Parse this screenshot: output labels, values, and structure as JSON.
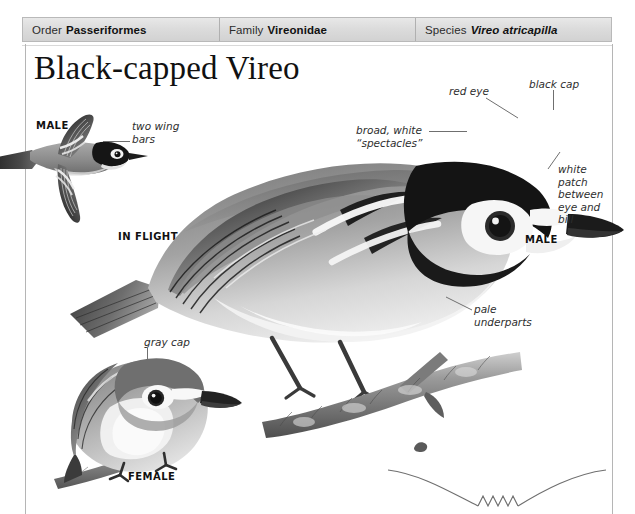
{
  "taxonomy": {
    "order": {
      "rank": "Order",
      "value": "Passeriformes"
    },
    "family": {
      "rank": "Family",
      "value": "Vireonidae"
    },
    "species": {
      "rank": "Species",
      "value": "Vireo atricapilla"
    }
  },
  "title": "Black-capped Vireo",
  "callouts": {
    "two_wing_bars": "two wing\nbars",
    "red_eye": "red eye",
    "black_cap": "black cap",
    "spectacles": "broad, white\n“spectacles”",
    "white_patch": "white\npatch\nbetween\neye and\nbill",
    "pale_underparts": "pale\nunderparts",
    "gray_cap": "gray cap"
  },
  "captions": {
    "male_flight": "MALE",
    "in_flight": "IN FLIGHT",
    "male_perched": "MALE",
    "female": "FEMALE"
  },
  "colors": {
    "page_background": "#ffffff",
    "header_fill": "#dcdcdc",
    "header_border": "#b9b9b9",
    "rule": "#b5b5b5",
    "text": "#1a1a1a",
    "leader_line": "#6f6f6f",
    "plumage_dark": "#2b2b2b",
    "plumage_mid": "#8d8d8d",
    "plumage_light": "#dedede",
    "branch": "#9a9a9a"
  }
}
